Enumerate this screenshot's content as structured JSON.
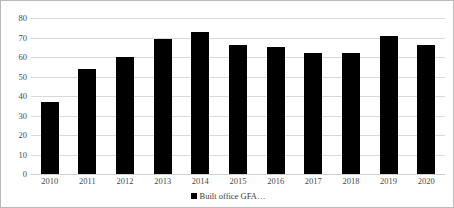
{
  "chart_data": {
    "type": "bar",
    "title": "",
    "xlabel": "",
    "ylabel": "",
    "categories": [
      "2010",
      "2011",
      "2012",
      "2013",
      "2014",
      "2015",
      "2016",
      "2017",
      "2018",
      "2019",
      "2020"
    ],
    "values": [
      37,
      54,
      60,
      69,
      73,
      66,
      65,
      62,
      62,
      71,
      66
    ],
    "series": [
      {
        "name": "Built office GFA…",
        "color": "#000000",
        "values": [
          37,
          54,
          60,
          69,
          73,
          66,
          65,
          62,
          62,
          71,
          66
        ]
      }
    ],
    "ylim": [
      0,
      80
    ],
    "y_ticks": [
      "0",
      "10",
      "20",
      "30",
      "40",
      "50",
      "60",
      "70",
      "80"
    ],
    "y_tick_values": [
      0,
      10,
      20,
      30,
      40,
      50,
      60,
      70,
      80
    ],
    "grid": true,
    "grid_color": "#d9d9d9",
    "legend": {
      "position": "bottom",
      "entries": [
        {
          "label": "Built office GFA…",
          "color": "#000000",
          "marker": "square"
        }
      ]
    },
    "bar_color": "#000000",
    "background_color": "#ffffff",
    "border_color": "#b9b9b9"
  }
}
